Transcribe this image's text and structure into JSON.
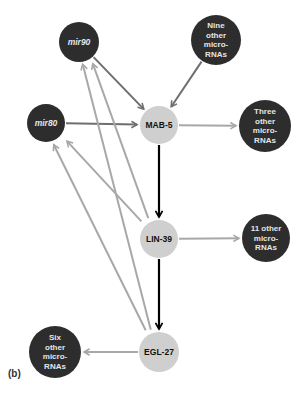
{
  "panel_label": "(b)",
  "colors": {
    "dark_node": "#2d2d2d",
    "light_node": "#cfcfcf",
    "dark_text": "#e6e6e6",
    "light_text": "#111111",
    "edge_dark": "#6e6e6e",
    "edge_light": "#a8a8a8",
    "edge_black": "#000000"
  },
  "nodes": [
    {
      "id": "mir90",
      "lines": [
        "mir90"
      ],
      "style": "dark",
      "italic": true
    },
    {
      "id": "nine",
      "lines": [
        "Nine",
        "other",
        "micro-",
        "RNAs"
      ],
      "style": "dark",
      "italic": false
    },
    {
      "id": "mir80",
      "lines": [
        "mir80"
      ],
      "style": "dark",
      "italic": true
    },
    {
      "id": "mab5",
      "lines": [
        "MAB-5"
      ],
      "style": "light",
      "italic": false
    },
    {
      "id": "three",
      "lines": [
        "Three",
        "other",
        "micro-",
        "RNAs"
      ],
      "style": "dark",
      "italic": false
    },
    {
      "id": "lin39",
      "lines": [
        "LIN-39"
      ],
      "style": "light",
      "italic": false
    },
    {
      "id": "eleven",
      "lines": [
        "11 other",
        "micro-",
        "RNAs"
      ],
      "style": "dark",
      "italic": false
    },
    {
      "id": "egl27",
      "lines": [
        "EGL-27"
      ],
      "style": "light",
      "italic": false
    },
    {
      "id": "six",
      "lines": [
        "Six",
        "other",
        "micro-",
        "RNAs"
      ],
      "style": "dark",
      "italic": false
    }
  ],
  "edges": [
    {
      "from": "mir90",
      "to": "mab5",
      "kind": "dark"
    },
    {
      "from": "nine",
      "to": "mab5",
      "kind": "dark"
    },
    {
      "from": "mir80",
      "to": "mab5",
      "kind": "dark"
    },
    {
      "from": "mab5",
      "to": "three",
      "kind": "light"
    },
    {
      "from": "mab5",
      "to": "lin39",
      "kind": "black"
    },
    {
      "from": "lin39",
      "to": "eleven",
      "kind": "light"
    },
    {
      "from": "lin39",
      "to": "egl27",
      "kind": "black"
    },
    {
      "from": "egl27",
      "to": "six",
      "kind": "light"
    },
    {
      "from": "lin39",
      "to": "mir80",
      "kind": "light"
    },
    {
      "from": "lin39",
      "to": "mir90",
      "kind": "light"
    },
    {
      "from": "egl27",
      "to": "mir80",
      "kind": "light"
    },
    {
      "from": "egl27",
      "to": "mir90",
      "kind": "light"
    }
  ]
}
